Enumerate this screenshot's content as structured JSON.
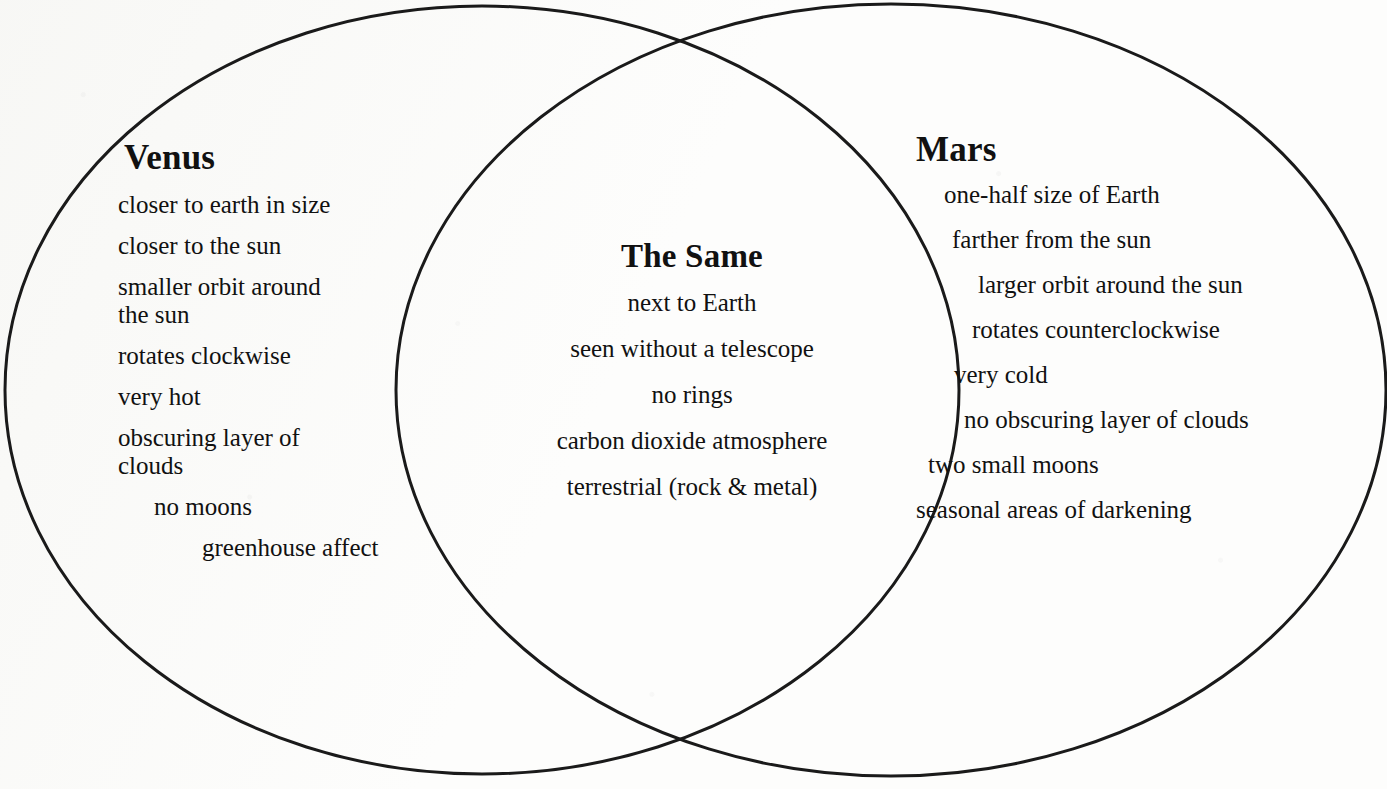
{
  "diagram": {
    "type": "venn",
    "title_left": "Venus",
    "title_center": "The Same",
    "title_right": "Mars",
    "stroke_color": "#1a1a1a",
    "background_color": "#fdfdfc",
    "text_color": "#111111"
  },
  "left": {
    "heading": "Venus",
    "items": [
      "closer to earth in size",
      "closer to the sun",
      "smaller orbit around\nthe sun",
      "rotates clockwise",
      "very hot",
      "obscuring layer of\nclouds",
      "no moons",
      "greenhouse affect"
    ]
  },
  "center": {
    "heading": "The Same",
    "items": [
      "next to Earth",
      "seen without a telescope",
      "no rings",
      "carbon dioxide atmosphere",
      "terrestrial (rock & metal)"
    ]
  },
  "right": {
    "heading": "Mars",
    "items": [
      "one-half size of Earth",
      "farther from the sun",
      "larger orbit around the sun",
      "rotates counterclockwise",
      "very cold",
      "no obscuring layer of clouds",
      "two small moons",
      "seasonal areas of darkening"
    ]
  },
  "geometry": {
    "left_ellipse": {
      "cx": 482,
      "cy": 390,
      "rx": 477,
      "ry": 384
    },
    "right_ellipse": {
      "cx": 891,
      "cy": 390,
      "rx": 495,
      "ry": 386
    },
    "stroke_width": 3
  }
}
